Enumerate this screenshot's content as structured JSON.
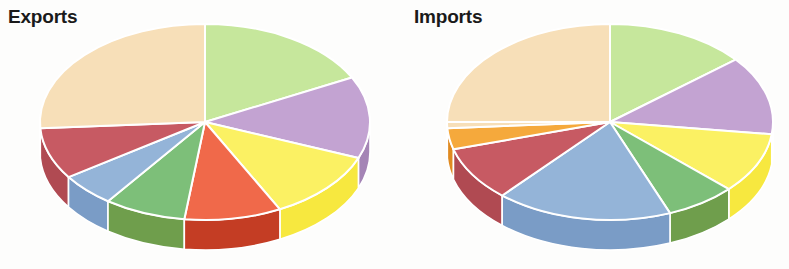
{
  "charts": [
    {
      "id": "exports",
      "title": "Exports",
      "center": [
        205,
        122
      ],
      "rx": 165,
      "ry": 98,
      "depth": 30,
      "start_angle": -90
    },
    {
      "id": "imports",
      "title": "Imports",
      "center": [
        216,
        122
      ],
      "rx": 163,
      "ry": 98,
      "depth": 30,
      "start_angle": -90
    }
  ],
  "chart_data": [
    {
      "type": "pie",
      "title": "Exports",
      "xlabel": "",
      "ylabel": "",
      "legend_position": "none",
      "grid": false,
      "three_d": true,
      "categories": [
        "Segment 1",
        "Segment 2",
        "Segment 3",
        "Segment 4",
        "Segment 5",
        "Segment 6",
        "Segment 7",
        "Segment 8"
      ],
      "values": [
        17.5,
        13.5,
        11.5,
        9.5,
        8.0,
        5.5,
        8.5,
        26.0
      ],
      "colors": [
        "#c6e79c",
        "#c3a3d2",
        "#fbf163",
        "#f0694a",
        "#7dbf79",
        "#94b4d8",
        "#c75a63",
        "#f7dfb8"
      ],
      "side_colors": [
        "#a9cf7b",
        "#a484b5",
        "#f7e83f",
        "#c43d24",
        "#6f9e4c",
        "#7a9cc6",
        "#b04a52",
        "#e9cb9c"
      ]
    },
    {
      "type": "pie",
      "title": "Imports",
      "xlabel": "",
      "ylabel": "",
      "legend_position": "none",
      "grid": false,
      "three_d": true,
      "categories": [
        "Segment 1",
        "Segment 2",
        "Segment 3",
        "Segment 4",
        "Segment 5",
        "Segment 6",
        "Segment 7",
        "Segment 8",
        "Segment 9"
      ],
      "values": [
        14.0,
        13.0,
        10.0,
        7.0,
        17.5,
        9.0,
        3.5,
        1.0,
        25.0
      ],
      "colors": [
        "#c6e79c",
        "#c3a3d2",
        "#fbf163",
        "#7dbf79",
        "#94b4d8",
        "#c75a63",
        "#f5a93c",
        "#f7dfb8",
        "#f7dfb8"
      ],
      "side_colors": [
        "#a9cf7b",
        "#a484b5",
        "#f7e83f",
        "#6f9e4c",
        "#7a9cc6",
        "#b04a52",
        "#e08a20",
        "#e9cb9c",
        "#e9cb9c"
      ]
    }
  ],
  "style": {
    "background": "#fdfdfc",
    "title_color": "#1a1a1a",
    "separator_color": "#ffffff"
  }
}
